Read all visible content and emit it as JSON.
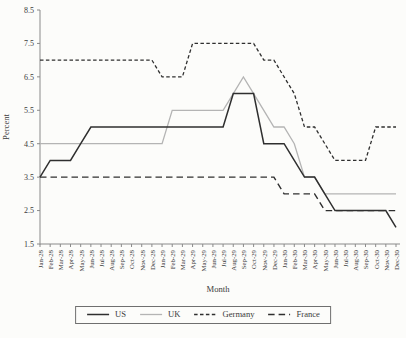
{
  "chart_data": {
    "type": "line",
    "title": "",
    "xlabel": "Month",
    "ylabel": "Percent",
    "ylim": [
      1.5,
      8.5
    ],
    "yticks": [
      1.5,
      2.5,
      3.5,
      4.5,
      5.5,
      6.5,
      7.5,
      8.5
    ],
    "grid": false,
    "legend_position": "bottom-center",
    "categories": [
      "Jan-28",
      "Feb-28",
      "Mar-28",
      "Apr-28",
      "May-28",
      "Jun-28",
      "Jul-28",
      "Aug-28",
      "Sep-28",
      "Oct-28",
      "Nov-28",
      "Dec-28",
      "Jan-29",
      "Feb-29",
      "Mar-29",
      "Apr-29",
      "May-29",
      "Jun-29",
      "Jul-29",
      "Aug-29",
      "Sep-29",
      "Oct-29",
      "Nov-29",
      "Dec-29",
      "Jan-30",
      "Feb-30",
      "Mar-30",
      "Apr-30",
      "May-30",
      "Jun-30",
      "Jul-30",
      "Aug-30",
      "Sep-30",
      "Oct-30",
      "Nov-30",
      "Dec-30"
    ],
    "series": [
      {
        "name": "US",
        "color": "#2f2f2f",
        "dash": "",
        "width": 1.5,
        "values": [
          3.5,
          4,
          4,
          4,
          4.5,
          5,
          5,
          5,
          5,
          5,
          5,
          5,
          5,
          5,
          5,
          5,
          5,
          5,
          5,
          6,
          6,
          6,
          4.5,
          4.5,
          4.5,
          4,
          3.5,
          3.5,
          3,
          2.5,
          2.5,
          2.5,
          2.5,
          2.5,
          2.5,
          2
        ]
      },
      {
        "name": "UK",
        "color": "#b4b4b4",
        "dash": "",
        "width": 1.3,
        "values": [
          4.5,
          4.5,
          4.5,
          4.5,
          4.5,
          4.5,
          4.5,
          4.5,
          4.5,
          4.5,
          4.5,
          4.5,
          4.5,
          5.5,
          5.5,
          5.5,
          5.5,
          5.5,
          5.5,
          6,
          6.5,
          6,
          5.5,
          5,
          5,
          4.5,
          3.5,
          3.5,
          3,
          3,
          3,
          3,
          3,
          3,
          3,
          3
        ]
      },
      {
        "name": "Germany",
        "color": "#2f2f2f",
        "dash": "3.5 2.4",
        "width": 1.3,
        "values": [
          7,
          7,
          7,
          7,
          7,
          7,
          7,
          7,
          7,
          7,
          7,
          7,
          6.5,
          6.5,
          6.5,
          7.5,
          7.5,
          7.5,
          7.5,
          7.5,
          7.5,
          7.5,
          7,
          7,
          6.5,
          6,
          5,
          5,
          4.5,
          4,
          4,
          4,
          4,
          5,
          5,
          5
        ]
      },
      {
        "name": "France",
        "color": "#2f2f2f",
        "dash": "6.5 4",
        "width": 1.4,
        "values": [
          3.5,
          3.5,
          3.5,
          3.5,
          3.5,
          3.5,
          3.5,
          3.5,
          3.5,
          3.5,
          3.5,
          3.5,
          3.5,
          3.5,
          3.5,
          3.5,
          3.5,
          3.5,
          3.5,
          3.5,
          3.5,
          3.5,
          3.5,
          3.5,
          3,
          3,
          3,
          3,
          2.5,
          2.5,
          2.5,
          2.5,
          2.5,
          2.5,
          2.5,
          2.5
        ]
      }
    ]
  }
}
